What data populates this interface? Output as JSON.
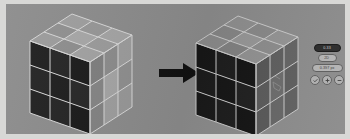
{
  "figure": {
    "background_color": "#8b8b8b",
    "frame_color": "#d8d8d6",
    "caption": ""
  },
  "arrow": {
    "name": "transformation-arrow",
    "direction": "right",
    "color": "#111111"
  },
  "cubes": [
    {
      "id": "cube-before",
      "label": "",
      "position": "left",
      "dimensions": "3x3x3",
      "faces": {
        "top": {
          "name": "top-face",
          "cells": [
            "#9d9d9d",
            "#969696",
            "#a3a3a3",
            "#8f8f8f",
            "#a6a6a6",
            "#9a9a9a",
            "#9b9b9b",
            "#8d8d8d",
            "#a1a1a1"
          ]
        },
        "left": {
          "name": "left-face",
          "cells": [
            "#1d1d1d",
            "#242424",
            "#1a1a1a",
            "#222222",
            "#1c1c1c",
            "#262626",
            "#1f1f1f",
            "#232323",
            "#191919"
          ]
        },
        "right": {
          "name": "right-face",
          "cells": [
            "#7e7e7e",
            "#8b8b8b",
            "#9b9b9b",
            "#848484",
            "#a4a4a4",
            "#8e8e8e",
            "#828282",
            "#9d9d9d",
            "#979797"
          ]
        }
      },
      "edge_color": "#d6d6d6"
    },
    {
      "id": "cube-after",
      "label": "",
      "position": "right",
      "dimensions": "3x3x3",
      "faces": {
        "top": {
          "name": "top-face",
          "cells": [
            "#8e8e8e",
            "#888888",
            "#939393",
            "#858585",
            "#969696",
            "#8c8c8c",
            "#8a8a8a",
            "#818181",
            "#919191"
          ]
        },
        "left": {
          "name": "left-face",
          "cells": [
            "#171717",
            "#1e1e1e",
            "#151515",
            "#1c1c1c",
            "#161616",
            "#202020",
            "#191919",
            "#1d1d1d",
            "#141414"
          ]
        },
        "right": {
          "name": "right-face",
          "cells": [
            "#565656",
            "#5e5e5e",
            "#636363",
            "#5a5a5a",
            "#6b6b6b",
            "#5d5d5d",
            "#585858",
            "#666666",
            "#606060"
          ]
        }
      },
      "edge_color": "#c9c9c9",
      "annotation": {
        "name": "center-cell-marking",
        "face": "right",
        "cell_index": 4
      }
    }
  ],
  "control_panel": {
    "name": "viewer-controls",
    "badge": {
      "name": "status-badge",
      "label": "0.33"
    },
    "toggle": {
      "name": "view-toggle",
      "label": "2D"
    },
    "value_field": {
      "name": "value-field",
      "label": "0.397 px"
    },
    "icon_buttons": [
      {
        "name": "check-icon",
        "glyph": "check"
      },
      {
        "name": "add-icon",
        "glyph": "plus"
      },
      {
        "name": "remove-icon",
        "glyph": "minus"
      }
    ]
  }
}
